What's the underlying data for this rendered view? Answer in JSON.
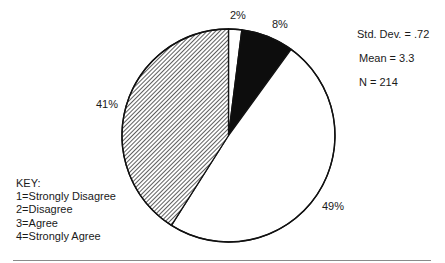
{
  "chart_data": {
    "type": "pie",
    "title": "",
    "slices": [
      {
        "key": "1",
        "label": "Strongly Disagree",
        "value": 2,
        "display": "2%",
        "fill": "white"
      },
      {
        "key": "2",
        "label": "Disagree",
        "value": 8,
        "display": "8%",
        "fill": "solid-black"
      },
      {
        "key": "3",
        "label": "Agree",
        "value": 49,
        "display": "49%",
        "fill": "white"
      },
      {
        "key": "4",
        "label": "Strongly Agree",
        "value": 41,
        "display": "41%",
        "fill": "diagonal-hatch"
      }
    ],
    "start_angle_deg": 0,
    "direction": "clockwise",
    "statistics": {
      "std_dev": ".72",
      "mean": "3.3",
      "n": "214"
    },
    "legend_position": "bottom-left"
  },
  "labels": {
    "slice1": "2%",
    "slice2": "8%",
    "slice3": "49%",
    "slice4": "41%"
  },
  "stats": {
    "std_dev": "Std. Dev. = .72",
    "mean": "Mean = 3.3",
    "n": "N = 214"
  },
  "key": {
    "title": "KEY:",
    "items": [
      "1=Strongly Disagree",
      "2=Disagree",
      "3=Agree",
      "4=Strongly Agree"
    ]
  },
  "colors": {
    "outline": "#111111",
    "solid": "#0d0d0d",
    "background": "#ffffff",
    "rule": "#8a8a8a"
  }
}
